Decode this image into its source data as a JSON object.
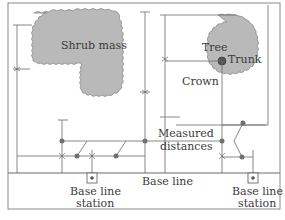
{
  "diagram": {
    "colors": {
      "mass_fill": "#b9b9b9",
      "line": "#6a6a6a",
      "frame": "#8a8a8a",
      "text": "#3a3a3a",
      "dot": "#707070"
    },
    "labels": {
      "shrub_mass": "Shrub mass",
      "tree": "Tree",
      "trunk": "Trunk",
      "crown": "Crown",
      "measured_1": "Measured",
      "measured_2": "distances",
      "base_line": "Base line",
      "station_left_1": "Base line",
      "station_left_2": "station",
      "station_right_1": "Base line",
      "station_right_2": "station"
    },
    "icons": {
      "station_marker": "square-with-dot",
      "trunk_marker": "filled-circle",
      "measurement_point": "dot"
    }
  }
}
